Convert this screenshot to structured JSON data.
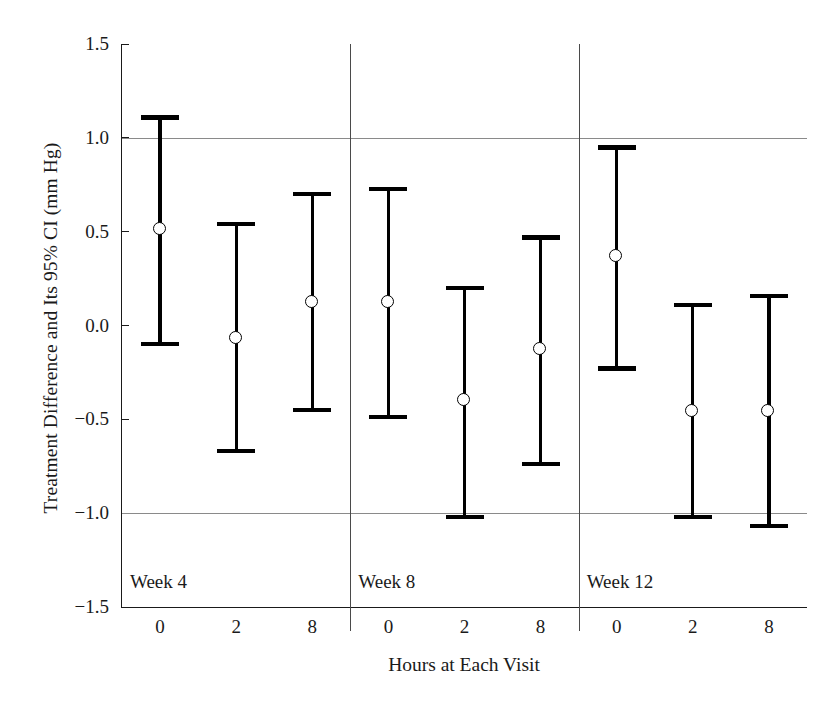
{
  "chart_data": {
    "type": "scatter",
    "title": "",
    "xlabel": "Hours at Each Visit",
    "ylabel": "Treatment Difference and Its 95% CI (mm Hg)",
    "ylim": [
      -1.5,
      1.5
    ],
    "yticks": [
      "1.5",
      "1.0",
      "0.5",
      "0.0",
      "−0.5",
      "−1.0",
      "−1.5"
    ],
    "ytick_values": [
      1.5,
      1.0,
      0.5,
      0.0,
      -0.5,
      -1.0,
      -1.5
    ],
    "grid": "horizontal reference lines at 1.0 and -1.0",
    "gridline_values": [
      1.0,
      -1.0
    ],
    "legend": "none",
    "groups": [
      "Week 4",
      "Week 8",
      "Week 12"
    ],
    "categories": [
      "0",
      "2",
      "8",
      "0",
      "2",
      "8",
      "0",
      "2",
      "8"
    ],
    "series": [
      {
        "name": "Treatment difference with 95% CI",
        "points": [
          {
            "group": "Week 4",
            "hour": "0",
            "value": 0.51,
            "ci_low": -0.11,
            "ci_high": 1.12
          },
          {
            "group": "Week 4",
            "hour": "2",
            "value": -0.07,
            "ci_low": -0.68,
            "ci_high": 0.55
          },
          {
            "group": "Week 4",
            "hour": "8",
            "value": 0.12,
            "ci_low": -0.46,
            "ci_high": 0.71
          },
          {
            "group": "Week 8",
            "hour": "0",
            "value": 0.12,
            "ci_low": -0.5,
            "ci_high": 0.74
          },
          {
            "group": "Week 8",
            "hour": "2",
            "value": -0.4,
            "ci_low": -1.03,
            "ci_high": 0.21
          },
          {
            "group": "Week 8",
            "hour": "8",
            "value": -0.13,
            "ci_low": -0.75,
            "ci_high": 0.48
          },
          {
            "group": "Week 12",
            "hour": "0",
            "value": 0.37,
            "ci_low": -0.24,
            "ci_high": 0.96
          },
          {
            "group": "Week 12",
            "hour": "2",
            "value": -0.46,
            "ci_low": -1.03,
            "ci_high": 0.12
          },
          {
            "group": "Week 12",
            "hour": "8",
            "value": -0.46,
            "ci_low": -1.08,
            "ci_high": 0.17
          }
        ]
      }
    ]
  },
  "axes": {
    "y_title": "Treatment Difference and Its 95% CI (mm Hg)",
    "x_title": "Hours at Each Visit"
  },
  "colors": {
    "marker": "#000000",
    "gridline": "#8a8a8a",
    "axis": "#1a1a1a",
    "background": "#ffffff"
  }
}
